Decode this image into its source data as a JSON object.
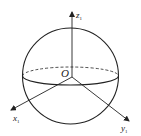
{
  "diagram": {
    "type": "sphere-with-coordinate-axes",
    "colors": {
      "stroke": "#222222",
      "background": "#ffffff"
    },
    "origin": {
      "label": "O"
    },
    "axes": [
      {
        "name": "x",
        "label": "x",
        "subscript": "1"
      },
      {
        "name": "y",
        "label": "y",
        "subscript": "1"
      },
      {
        "name": "z",
        "label": "z",
        "subscript": "1"
      }
    ],
    "equator": {
      "front": "solid",
      "back": "dashed"
    }
  }
}
